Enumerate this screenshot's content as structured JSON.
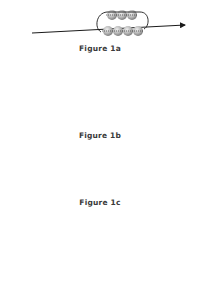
{
  "figures": [
    {
      "id": "1a",
      "label": "Figure 1a"
    },
    {
      "id": "1b",
      "label": "Figure 1b"
    },
    {
      "id": "1c",
      "label": "Figure 1c"
    },
    {
      "id": "1d",
      "label": ""
    }
  ],
  "colors": {
    "bead_light": "#e8e8e8",
    "bead_dark": "#8a8a8a",
    "thread": "#1a1a1a",
    "label": "#3a3a3a"
  }
}
